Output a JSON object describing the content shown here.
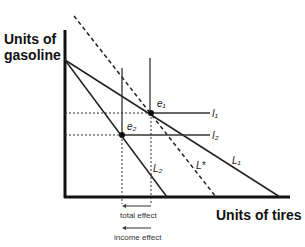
{
  "axes": {
    "y_label_line1": "Units of",
    "y_label_line2": "gasoline",
    "x_label": "Units of tires"
  },
  "lines": {
    "L1": "L₁",
    "L2": "L₂",
    "Lstar": "L*",
    "I1": "I₁",
    "I2": "I₂"
  },
  "points": {
    "e1": "e₁",
    "e2": "e₂"
  },
  "annotations": {
    "total_effect": "total effect",
    "income_effect": "income effect"
  },
  "colors": {
    "line": "#222222",
    "background": "#ffffff"
  }
}
